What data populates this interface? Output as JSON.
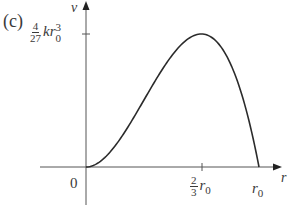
{
  "panel_label": "(c)",
  "chart_data": {
    "type": "line",
    "title": "",
    "xlabel": "r",
    "ylabel": "v",
    "function": "v = k r^2 (r0 - r)",
    "x_ticks": [
      {
        "label": "0",
        "value": 0
      },
      {
        "label": "2/3 r0",
        "value": 0.6667
      },
      {
        "label": "r0",
        "value": 1
      }
    ],
    "y_ticks": [
      {
        "label": "4/27 k r0^3",
        "value": 0.1481
      }
    ],
    "xlim": [
      0,
      1.1
    ],
    "ylim": [
      0,
      0.16
    ],
    "grid": false,
    "legend": null,
    "series": [
      {
        "name": "v(r)",
        "x": [
          0,
          0.1,
          0.2,
          0.3,
          0.4,
          0.5,
          0.6,
          0.6667,
          0.7,
          0.8,
          0.9,
          1.0
        ],
        "y": [
          0,
          0.009,
          0.032,
          0.063,
          0.096,
          0.125,
          0.144,
          0.1481,
          0.147,
          0.128,
          0.081,
          0
        ]
      }
    ]
  },
  "labels": {
    "y_axis": "v",
    "x_axis": "r",
    "origin": "0",
    "ytick_frac_num": "4",
    "ytick_frac_den": "27",
    "ytick_k": "k",
    "ytick_r": "r",
    "ytick_sup": "3",
    "ytick_sub": "0",
    "xtick1_frac_num": "2",
    "xtick1_frac_den": "3",
    "xtick1_r": "r",
    "xtick1_sub": "0",
    "xtick2_r": "r",
    "xtick2_sub": "0"
  }
}
